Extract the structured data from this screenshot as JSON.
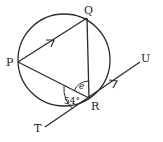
{
  "diagram": {
    "type": "circle-geometry",
    "colors": {
      "stroke": "#2a2a2a",
      "text": "#222222",
      "background": "#ffffff"
    },
    "circle": {
      "cx": 64,
      "cy": 60,
      "r": 46
    },
    "points": {
      "P": {
        "label": "P",
        "x": 18,
        "y": 62
      },
      "Q": {
        "label": "Q",
        "x": 87,
        "y": 18
      },
      "R": {
        "label": "R",
        "x": 89,
        "y": 98
      },
      "T": {
        "label": "T",
        "x": 45,
        "y": 127
      },
      "U": {
        "label": "U",
        "x": 140,
        "y": 62
      }
    },
    "segments": [
      {
        "from": "P",
        "to": "Q",
        "parallel_marker": true
      },
      {
        "from": "Q",
        "to": "R",
        "parallel_marker": false
      },
      {
        "from": "P",
        "to": "R",
        "parallel_marker": false
      },
      {
        "from": "T",
        "to": "U",
        "parallel_marker": true,
        "tangent_at": "R"
      }
    ],
    "angles": [
      {
        "name": "angle-TRP",
        "value_label": "54°",
        "between": [
          "T",
          "P"
        ],
        "at": "R"
      },
      {
        "name": "angle-PRQ",
        "value_label": "e",
        "between": [
          "P",
          "Q"
        ],
        "at": "R"
      }
    ],
    "labels": {
      "P": "P",
      "Q": "Q",
      "R": "R",
      "T": "T",
      "U": "U",
      "angle_54": "54°",
      "angle_e": "e"
    }
  }
}
